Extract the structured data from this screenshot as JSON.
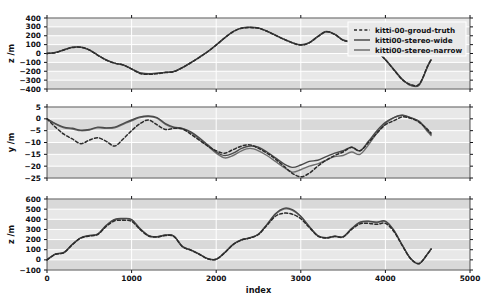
{
  "figure": {
    "title_faint": "",
    "background": "#ffffff",
    "band_color": "#d9d9d9",
    "gridline_color": "#ffffff",
    "series_colors": {
      "ground_truth": "#2b2b2b",
      "stereo_wide": "#4a4a4a",
      "stereo_narrow": "#6e6e6e"
    }
  },
  "legend": {
    "position": "upper-right-panel-1",
    "entries": [
      {
        "label": "kitti-00-groud-truth",
        "style": "dashed",
        "color": "#2b2b2b"
      },
      {
        "label": "kitti00-stereo-wide",
        "style": "solid",
        "color": "#4a4a4a"
      },
      {
        "label": "kitti00-stereo-narrow",
        "style": "solid",
        "color": "#6e6e6e"
      }
    ]
  },
  "chart_data": [
    {
      "type": "line",
      "panel": 1,
      "title": "",
      "xlabel": "",
      "ylabel": "z /m",
      "xlim": [
        0,
        5000
      ],
      "ylim": [
        -400,
        400
      ],
      "yticks": [
        -400,
        -300,
        -200,
        -100,
        0,
        100,
        200,
        300,
        400
      ],
      "ytick_labels": [
        "-400",
        "-300",
        "-200",
        "-100",
        "0",
        "100",
        "200",
        "300",
        "400"
      ],
      "xticks": [
        0,
        1000,
        2000,
        3000,
        4000,
        5000
      ],
      "xtick_labels": [
        "",
        "",
        "",
        "",
        "",
        ""
      ],
      "grid": true,
      "x": [
        0,
        100,
        200,
        300,
        400,
        500,
        600,
        700,
        800,
        900,
        1000,
        1100,
        1200,
        1300,
        1400,
        1500,
        1600,
        1700,
        1800,
        1900,
        2000,
        2100,
        2200,
        2300,
        2400,
        2500,
        2600,
        2700,
        2800,
        2900,
        3000,
        3100,
        3200,
        3300,
        3400,
        3500,
        3600,
        3700,
        3800,
        3900,
        4000,
        4100,
        4200,
        4300,
        4400,
        4500,
        4540
      ],
      "series": [
        {
          "name": "kitti-00-groud-truth",
          "style": "dashed",
          "values": [
            0,
            10,
            40,
            68,
            70,
            40,
            -20,
            -75,
            -110,
            -130,
            -175,
            -225,
            -235,
            -228,
            -215,
            -205,
            -160,
            -105,
            -45,
            20,
            95,
            175,
            245,
            285,
            292,
            285,
            250,
            205,
            160,
            120,
            95,
            120,
            190,
            245,
            215,
            150,
            130,
            120,
            70,
            20,
            -70,
            -185,
            -295,
            -350,
            -345,
            -140,
            -70
          ]
        },
        {
          "name": "kitti00-stereo-wide",
          "style": "solid",
          "values": [
            0,
            12,
            42,
            70,
            72,
            42,
            -18,
            -72,
            -108,
            -128,
            -172,
            -218,
            -228,
            -222,
            -212,
            -202,
            -158,
            -102,
            -42,
            22,
            98,
            178,
            248,
            288,
            295,
            288,
            252,
            208,
            162,
            122,
            98,
            122,
            192,
            248,
            218,
            152,
            132,
            122,
            72,
            22,
            -68,
            -180,
            -290,
            -358,
            -352,
            -145,
            -72
          ]
        },
        {
          "name": "kitti00-stereo-narrow",
          "style": "solid",
          "values": [
            0,
            11,
            41,
            69,
            71,
            41,
            -19,
            -73,
            -109,
            -129,
            -173,
            -220,
            -230,
            -224,
            -213,
            -203,
            -159,
            -103,
            -43,
            21,
            96,
            176,
            246,
            286,
            293,
            286,
            251,
            206,
            161,
            121,
            96,
            121,
            191,
            246,
            216,
            151,
            131,
            121,
            71,
            21,
            -69,
            -182,
            -292,
            -360,
            -355,
            -143,
            -71
          ]
        }
      ]
    },
    {
      "type": "line",
      "panel": 2,
      "title": "",
      "xlabel": "",
      "ylabel": "y /m",
      "xlim": [
        0,
        5000
      ],
      "ylim": [
        -25,
        5
      ],
      "yticks": [
        -25,
        -20,
        -15,
        -10,
        -5,
        0,
        5
      ],
      "ytick_labels": [
        "-25",
        "-20",
        "-15",
        "-10",
        "-5",
        "0",
        "5"
      ],
      "xticks": [
        0,
        1000,
        2000,
        3000,
        4000,
        5000
      ],
      "xtick_labels": [
        "",
        "",
        "",
        "",
        "",
        ""
      ],
      "grid": true,
      "x": [
        0,
        100,
        200,
        300,
        400,
        500,
        600,
        700,
        800,
        900,
        1000,
        1100,
        1200,
        1300,
        1400,
        1500,
        1600,
        1700,
        1800,
        1900,
        2000,
        2100,
        2200,
        2300,
        2400,
        2500,
        2600,
        2700,
        2800,
        2900,
        3000,
        3100,
        3200,
        3300,
        3400,
        3500,
        3600,
        3700,
        3800,
        3900,
        4000,
        4100,
        4200,
        4300,
        4400,
        4500,
        4540
      ],
      "series": [
        {
          "name": "kitti-00-groud-truth",
          "style": "dashed",
          "values": [
            0,
            -3.5,
            -6.5,
            -8.5,
            -10.5,
            -9.0,
            -8.0,
            -9.5,
            -11.5,
            -8.5,
            -5.0,
            -2.0,
            -0.5,
            -2.5,
            -4.5,
            -4.0,
            -4.2,
            -6.5,
            -9.0,
            -11.5,
            -13.5,
            -14.5,
            -13.0,
            -11.5,
            -11.0,
            -12.5,
            -14.5,
            -17.0,
            -20.0,
            -23.0,
            -24.5,
            -23.0,
            -20.0,
            -17.5,
            -15.5,
            -14.0,
            -12.0,
            -13.5,
            -10.0,
            -6.0,
            -2.5,
            -0.8,
            0.8,
            0.2,
            -1.5,
            -4.5,
            -6.0
          ]
        },
        {
          "name": "kitti00-stereo-wide",
          "style": "solid",
          "values": [
            0,
            -2.0,
            -3.5,
            -4.0,
            -4.8,
            -4.5,
            -3.5,
            -3.8,
            -3.5,
            -2.0,
            -0.5,
            0.8,
            1.2,
            0.5,
            -2.0,
            -3.5,
            -4.0,
            -5.5,
            -8.0,
            -11.0,
            -14.0,
            -15.5,
            -14.5,
            -12.5,
            -11.5,
            -12.0,
            -14.0,
            -16.5,
            -19.0,
            -20.5,
            -19.5,
            -18.0,
            -17.5,
            -16.0,
            -14.5,
            -13.5,
            -12.0,
            -13.5,
            -9.5,
            -5.0,
            -1.5,
            0.5,
            1.5,
            0.5,
            -1.0,
            -5.0,
            -6.5
          ]
        },
        {
          "name": "kitti00-stereo-narrow",
          "style": "solid",
          "values": [
            0,
            -2.2,
            -3.8,
            -4.3,
            -5.0,
            -4.7,
            -3.8,
            -4.0,
            -3.8,
            -2.3,
            -0.8,
            0.5,
            1.0,
            0.3,
            -2.3,
            -3.8,
            -4.3,
            -5.8,
            -8.5,
            -11.5,
            -14.5,
            -16.5,
            -15.5,
            -13.5,
            -12.5,
            -13.5,
            -15.5,
            -18.0,
            -20.5,
            -22.5,
            -21.5,
            -20.0,
            -19.0,
            -17.5,
            -16.0,
            -15.5,
            -14.0,
            -15.0,
            -11.0,
            -6.0,
            -2.0,
            0.5,
            1.5,
            0.3,
            -1.2,
            -5.5,
            -7.0
          ]
        }
      ]
    },
    {
      "type": "line",
      "panel": 3,
      "title": "",
      "xlabel": "index",
      "ylabel": "z /m",
      "xlim": [
        0,
        5000
      ],
      "ylim": [
        -100,
        600
      ],
      "yticks": [
        -100,
        0,
        100,
        200,
        300,
        400,
        500,
        600
      ],
      "ytick_labels": [
        "-100",
        "0",
        "100",
        "200",
        "300",
        "400",
        "500",
        "600"
      ],
      "xticks": [
        0,
        1000,
        2000,
        3000,
        4000,
        5000
      ],
      "xtick_labels": [
        "0",
        "1000",
        "2000",
        "3000",
        "4000",
        "5000"
      ],
      "grid": true,
      "x": [
        0,
        100,
        200,
        300,
        400,
        500,
        600,
        700,
        800,
        900,
        1000,
        1100,
        1200,
        1300,
        1400,
        1500,
        1600,
        1700,
        1800,
        1900,
        2000,
        2100,
        2200,
        2300,
        2400,
        2500,
        2600,
        2700,
        2800,
        2900,
        3000,
        3100,
        3200,
        3300,
        3400,
        3500,
        3600,
        3700,
        3800,
        3900,
        4000,
        4100,
        4200,
        4300,
        4400,
        4500,
        4540
      ],
      "series": [
        {
          "name": "kitti-00-groud-truth",
          "style": "dashed",
          "values": [
            0,
            55,
            70,
            150,
            215,
            235,
            250,
            330,
            385,
            390,
            380,
            300,
            235,
            225,
            240,
            230,
            130,
            95,
            55,
            10,
            5,
            70,
            150,
            195,
            215,
            250,
            340,
            430,
            460,
            450,
            405,
            320,
            235,
            215,
            230,
            225,
            300,
            355,
            360,
            350,
            360,
            280,
            140,
            10,
            -35,
            60,
            105
          ]
        },
        {
          "name": "kitti00-stereo-wide",
          "style": "solid",
          "values": [
            0,
            58,
            73,
            153,
            218,
            240,
            255,
            340,
            400,
            408,
            398,
            308,
            240,
            228,
            245,
            235,
            133,
            98,
            57,
            12,
            6,
            72,
            153,
            198,
            218,
            255,
            350,
            455,
            508,
            495,
            430,
            330,
            240,
            218,
            233,
            228,
            308,
            372,
            382,
            372,
            382,
            292,
            145,
            12,
            -38,
            62,
            108
          ]
        },
        {
          "name": "kitti00-stereo-narrow",
          "style": "solid",
          "values": [
            0,
            57,
            72,
            152,
            217,
            238,
            253,
            337,
            396,
            403,
            394,
            305,
            238,
            227,
            243,
            233,
            132,
            97,
            56,
            11,
            6,
            71,
            152,
            197,
            217,
            253,
            347,
            450,
            500,
            488,
            425,
            327,
            238,
            217,
            232,
            227,
            305,
            368,
            378,
            368,
            378,
            289,
            143,
            11,
            -37,
            61,
            107
          ]
        }
      ]
    }
  ]
}
